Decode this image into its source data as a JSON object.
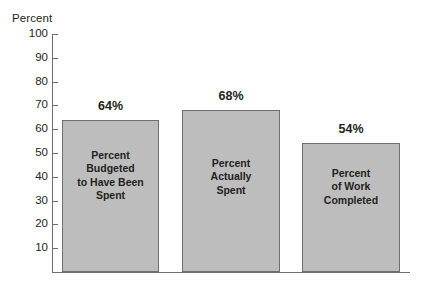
{
  "chart_data": {
    "type": "bar",
    "title": "",
    "xlabel": "",
    "ylabel": "Percent",
    "ylim": [
      0,
      100
    ],
    "grid": false,
    "legend": false,
    "categories": [
      "Percent Budgeted to Have Been Spent",
      "Percent Actually Spent",
      "Percent of Work Completed"
    ],
    "values": [
      64,
      68,
      54
    ],
    "value_labels": [
      "64%",
      "68%",
      "54%"
    ],
    "bar_labels": [
      "Percent\nBudgeted\nto Have Been\nSpent",
      "Percent\nActually\nSpent",
      "Percent\nof Work\nCompleted"
    ],
    "ytick_labels": [
      "100",
      "90",
      "80",
      "70",
      "60",
      "50",
      "40",
      "30",
      "20",
      "10"
    ],
    "ytick_values": [
      100,
      90,
      80,
      70,
      60,
      50,
      40,
      30,
      20,
      10
    ],
    "colors": {
      "bar_fill": "#bdbdbd",
      "bar_stroke": "#6f6f6f",
      "axis": "#6f6f6f",
      "text": "#231f20",
      "background": "#ffffff"
    }
  }
}
